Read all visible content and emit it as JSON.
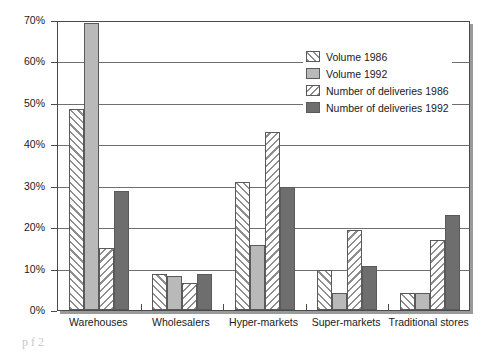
{
  "chart_data": {
    "type": "bar",
    "title": "",
    "xlabel": "",
    "ylabel": "",
    "ylim": [
      0,
      70
    ],
    "yticks": [
      "0%",
      "10%",
      "20%",
      "30%",
      "40%",
      "50%",
      "60%",
      "70%"
    ],
    "ytick_values": [
      0,
      10,
      20,
      30,
      40,
      50,
      60,
      70
    ],
    "grid": true,
    "legend_position": "upper-right-inside",
    "categories": [
      "Warehouses",
      "Wholesalers",
      "Hyper-markets",
      "Super-markets",
      "Traditional stores"
    ],
    "series": [
      {
        "name": "Volume 1986",
        "values": [
          48.5,
          8.6,
          30.8,
          9.7,
          4.0
        ],
        "fill": "hatch-forward",
        "color": "#8e8e8e"
      },
      {
        "name": "Volume 1992",
        "values": [
          69.2,
          8.2,
          15.8,
          4.0,
          4.0
        ],
        "fill": "solid",
        "color": "#b9b9b9"
      },
      {
        "name": "Number of deliveries 1986",
        "values": [
          15.0,
          6.6,
          43.0,
          19.3,
          17.0
        ],
        "fill": "hatch-backward",
        "color": "#8e8e8e"
      },
      {
        "name": "Number of deliveries 1992",
        "values": [
          28.7,
          8.7,
          29.7,
          10.6,
          23.0
        ],
        "fill": "solid",
        "color": "#6e6e6e"
      }
    ]
  },
  "scan_fragment": "p    f    2"
}
